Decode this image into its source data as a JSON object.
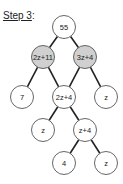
{
  "title": {
    "step": "Step 3",
    "suffix": ":"
  },
  "colors": {
    "shaded": "#d0d0d0",
    "plain": "#ffffff",
    "stroke": "#555555",
    "edge": "#222222"
  },
  "tree": {
    "nodes": [
      {
        "id": "n55",
        "label": "55",
        "x": 64,
        "y": 27,
        "shaded": false
      },
      {
        "id": "n2z11",
        "label": "2z+11",
        "x": 43,
        "y": 57,
        "shaded": true
      },
      {
        "id": "n3z4",
        "label": "3z+4",
        "x": 85,
        "y": 57,
        "shaded": true
      },
      {
        "id": "n7",
        "label": "7",
        "x": 22,
        "y": 97,
        "shaded": false
      },
      {
        "id": "n2z4",
        "label": "2z+4",
        "x": 64,
        "y": 97,
        "shaded": false
      },
      {
        "id": "nz1",
        "label": "z",
        "x": 106,
        "y": 97,
        "shaded": false
      },
      {
        "id": "nz2",
        "label": "z",
        "x": 43,
        "y": 130,
        "shaded": false
      },
      {
        "id": "nz4",
        "label": "z+4",
        "x": 85,
        "y": 130,
        "shaded": false
      },
      {
        "id": "n4",
        "label": "4",
        "x": 64,
        "y": 163,
        "shaded": false
      },
      {
        "id": "nz3",
        "label": "z",
        "x": 106,
        "y": 163,
        "shaded": false
      }
    ],
    "edges": [
      [
        "n55",
        "n2z11"
      ],
      [
        "n55",
        "n3z4"
      ],
      [
        "n2z11",
        "n7"
      ],
      [
        "n2z11",
        "n2z4"
      ],
      [
        "n3z4",
        "n2z4"
      ],
      [
        "n3z4",
        "nz1"
      ],
      [
        "n2z4",
        "nz2"
      ],
      [
        "n2z4",
        "nz4"
      ],
      [
        "nz4",
        "n4"
      ],
      [
        "nz4",
        "nz3"
      ]
    ],
    "radius": 11.5
  }
}
